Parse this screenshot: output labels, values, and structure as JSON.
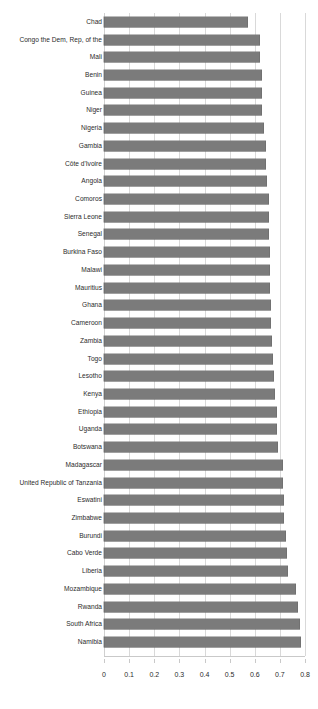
{
  "chart_data": {
    "type": "bar",
    "orientation": "horizontal",
    "title": "",
    "subtitle": "",
    "xlabel": "",
    "ylabel": "",
    "xlim": [
      0,
      0.8
    ],
    "xticks": [
      0,
      0.1,
      0.2,
      0.3,
      0.4,
      0.5,
      0.6,
      0.7,
      0.8
    ],
    "xtick_labels": [
      "0",
      "0.1",
      "0.2",
      "0.3",
      "0.4",
      "0.5",
      "0.6",
      "0.7",
      "0.8"
    ],
    "grid": "vertical",
    "legend": "none",
    "bar_color": "#7b7b7b",
    "categories": [
      "Chad",
      "Congo the Dem, Rep, of the",
      "Mali",
      "Benin",
      "Guinea",
      "Niger",
      "Nigeria",
      "Gambia",
      "Côte d'Ivoire",
      "Angola",
      "Comoros",
      "Sierra Leone",
      "Senegal",
      "Burkina Faso",
      "Malawi",
      "Mauritius",
      "Ghana",
      "Cameroon",
      "Zambia",
      "Togo",
      "Lesotho",
      "Kenya",
      "Ethiopia",
      "Uganda",
      "Botswana",
      "Madagascar",
      "United Republic of Tanzania",
      "Eswatini",
      "Zimbabwe",
      "Burundi",
      "Cabo Verde",
      "Liberia",
      "Mozambique",
      "Rwanda",
      "South Africa",
      "Namibia"
    ],
    "values": [
      0.574,
      0.619,
      0.62,
      0.627,
      0.628,
      0.629,
      0.637,
      0.644,
      0.645,
      0.648,
      0.655,
      0.656,
      0.657,
      0.66,
      0.661,
      0.662,
      0.665,
      0.666,
      0.668,
      0.674,
      0.678,
      0.681,
      0.688,
      0.69,
      0.694,
      0.711,
      0.713,
      0.715,
      0.718,
      0.726,
      0.729,
      0.733,
      0.764,
      0.772,
      0.78,
      0.784
    ]
  }
}
